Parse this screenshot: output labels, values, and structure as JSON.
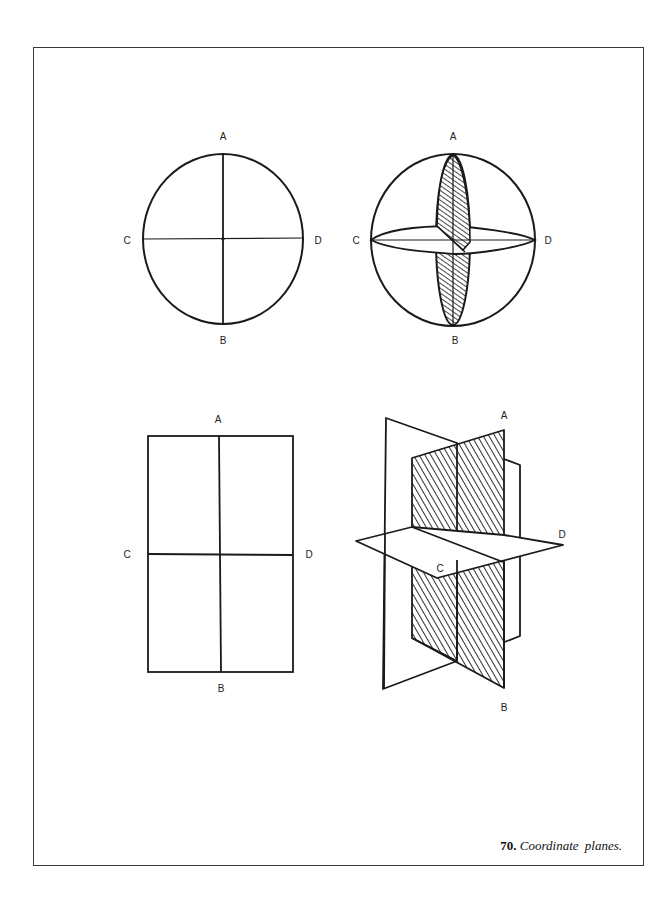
{
  "figure": {
    "caption_number": "70.",
    "caption_text": "Coordinate planes."
  },
  "panels": [
    {
      "name": "circle-plain",
      "labels": {
        "top": "A",
        "bottom": "B",
        "left": "C",
        "right": "D"
      }
    },
    {
      "name": "sphere-planes",
      "labels": {
        "top": "A",
        "bottom": "B",
        "left": "C",
        "right": "D"
      }
    },
    {
      "name": "rectangle-plain",
      "labels": {
        "top": "A",
        "bottom": "B",
        "left": "C",
        "right": "D"
      }
    },
    {
      "name": "perspective-planes",
      "labels": {
        "top": "A",
        "bottom": "B",
        "left": "C",
        "right": "D"
      }
    }
  ],
  "colors": {
    "ink": "#1a1a1a",
    "frame": "#3a3a3a",
    "background": "#ffffff"
  }
}
